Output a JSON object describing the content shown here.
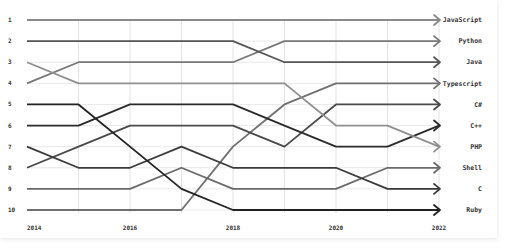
{
  "chart_data": {
    "type": "line",
    "subtype": "bump",
    "title": "",
    "xlabel": "",
    "ylabel": "",
    "x": [
      2014,
      2015,
      2016,
      2017,
      2018,
      2019,
      2020,
      2021,
      2022
    ],
    "x_tick_labels": [
      "2014",
      "2016",
      "2018",
      "2020",
      "2022"
    ],
    "x_tick_values": [
      2014,
      2016,
      2018,
      2020,
      2022
    ],
    "y_tick_labels": [
      "1",
      "2",
      "3",
      "4",
      "5",
      "6",
      "7",
      "8",
      "9",
      "10"
    ],
    "ylim": [
      1,
      10
    ],
    "y_inverted": true,
    "grid": true,
    "legend": "end-labels-right",
    "series": [
      {
        "name": "JavaScript",
        "values": [
          1,
          1,
          1,
          1,
          1,
          1,
          1,
          1,
          1
        ],
        "color": "#8a8a8a"
      },
      {
        "name": "Python",
        "values": [
          4,
          3,
          3,
          3,
          3,
          2,
          2,
          2,
          2
        ],
        "color": "#777777"
      },
      {
        "name": "Java",
        "values": [
          2,
          2,
          2,
          2,
          2,
          3,
          3,
          3,
          3
        ],
        "color": "#555555"
      },
      {
        "name": "Typescript",
        "values": [
          10,
          10,
          10,
          10,
          7,
          5,
          4,
          4,
          4
        ],
        "color": "#6f6f6f"
      },
      {
        "name": "C#",
        "values": [
          8,
          7,
          6,
          6,
          6,
          7,
          5,
          5,
          5
        ],
        "color": "#4a4a4a"
      },
      {
        "name": "C++",
        "values": [
          6,
          6,
          5,
          5,
          5,
          6,
          7,
          7,
          6
        ],
        "color": "#2a2a2a"
      },
      {
        "name": "PHP",
        "values": [
          3,
          4,
          4,
          4,
          4,
          4,
          6,
          6,
          7
        ],
        "color": "#8f8f8f"
      },
      {
        "name": "Shell",
        "values": [
          9,
          9,
          9,
          8,
          9,
          9,
          9,
          8,
          8
        ],
        "color": "#6a6a6a"
      },
      {
        "name": "C",
        "values": [
          7,
          8,
          8,
          7,
          8,
          8,
          8,
          9,
          9
        ],
        "color": "#3a3a3a"
      },
      {
        "name": "Ruby",
        "values": [
          5,
          5,
          7,
          9,
          10,
          10,
          10,
          10,
          10
        ],
        "color": "#222222"
      }
    ]
  }
}
